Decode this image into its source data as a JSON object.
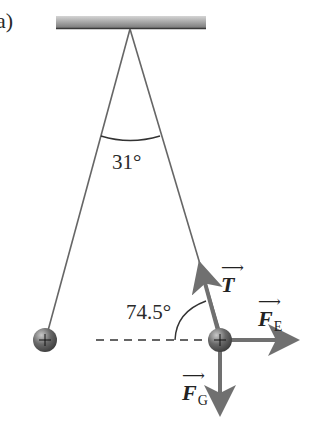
{
  "figure": {
    "part_label": "a)",
    "angle_between_strings": "31°",
    "angle_tension_horizontal": "74.5°",
    "vectors": {
      "tension": {
        "symbol": "T",
        "arrow": "⟶"
      },
      "electric_force": {
        "symbol": "F",
        "subscript": "E",
        "arrow": "⟶"
      },
      "gravity_force": {
        "symbol": "F",
        "subscript": "G",
        "arrow": "⟶"
      }
    },
    "charge_symbol": "+",
    "colors": {
      "string": "#666666",
      "vector": "#707070",
      "ceiling": "#8a8a8a",
      "sphere": "#5a5a5a"
    }
  }
}
